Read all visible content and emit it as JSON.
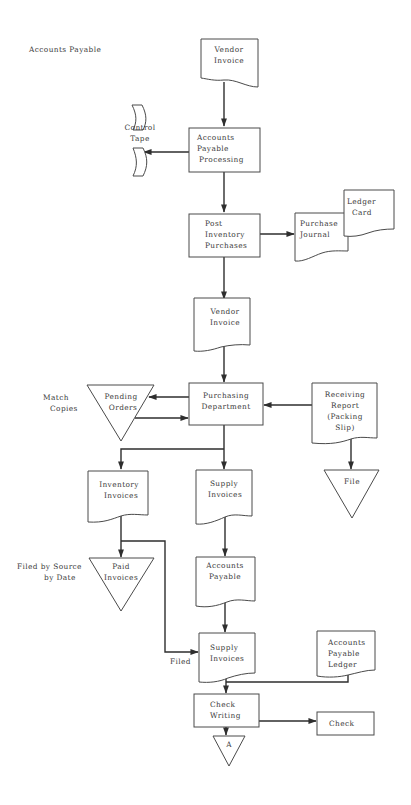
{
  "title": "Accounts Payable",
  "colors": {
    "line": "#2e2e2e",
    "shape_stroke": "#4a4a4a",
    "text": "#3a3a3a",
    "background": "#ffffff"
  },
  "nodes": {
    "vendor_invoice_1": {
      "type": "document",
      "lines": [
        "Vendor",
        "Invoice"
      ]
    },
    "control_tape": {
      "type": "punched-tape",
      "lines": [
        "Control",
        "Tape"
      ]
    },
    "ap_processing": {
      "type": "process",
      "lines": [
        "Accounts",
        "Payable",
        "Processing"
      ]
    },
    "post_inventory": {
      "type": "process",
      "lines": [
        "Post",
        "Inventory",
        "Purchases"
      ]
    },
    "purchase_journal": {
      "type": "document",
      "lines": [
        "Purchase",
        "Journal"
      ]
    },
    "ledger_card": {
      "type": "document",
      "lines": [
        "Ledger",
        "Card"
      ]
    },
    "vendor_invoice_2": {
      "type": "document",
      "lines": [
        "Vendor",
        "Invoice"
      ]
    },
    "purchasing_department": {
      "type": "process",
      "lines": [
        "Purchasing",
        "Department"
      ]
    },
    "pending_orders": {
      "type": "file",
      "lines": [
        "Pending",
        "Orders"
      ]
    },
    "receiving_report": {
      "type": "document",
      "lines": [
        "Receiving",
        "Report",
        "(Packing",
        "Slip)"
      ]
    },
    "file": {
      "type": "file",
      "lines": [
        "File"
      ]
    },
    "inventory_invoices": {
      "type": "document",
      "lines": [
        "Inventory",
        "Invoices"
      ]
    },
    "supply_invoices_1": {
      "type": "document",
      "lines": [
        "Supply",
        "Invoices"
      ]
    },
    "paid_invoices": {
      "type": "file",
      "lines": [
        "Paid",
        "Invoices"
      ]
    },
    "accounts_payable_doc": {
      "type": "document",
      "lines": [
        "Accounts",
        "Payable"
      ]
    },
    "supply_invoices_2": {
      "type": "document",
      "lines": [
        "Supply",
        "Invoices"
      ]
    },
    "ap_ledger": {
      "type": "document",
      "lines": [
        "Accounts",
        "Payable",
        "Ledger"
      ]
    },
    "check_writing": {
      "type": "process",
      "lines": [
        "Check",
        "Writing"
      ]
    },
    "check": {
      "type": "process",
      "lines": [
        "Check"
      ]
    },
    "connector_a": {
      "type": "off-page-connector",
      "lines": [
        "A"
      ]
    }
  },
  "annotations": {
    "match_copies": [
      "Match",
      "Copies"
    ],
    "filed_by_source": [
      "Filed by Source",
      "by Date"
    ],
    "filed": [
      "Filed"
    ]
  },
  "edges": [
    {
      "from": "Vendor Invoice",
      "to": "Accounts Payable Processing"
    },
    {
      "from": "Accounts Payable Processing",
      "to": "Control Tape"
    },
    {
      "from": "Accounts Payable Processing",
      "to": "Post Inventory Purchases"
    },
    {
      "from": "Post Inventory Purchases",
      "to": "Purchase Journal / Ledger Card"
    },
    {
      "from": "Post Inventory Purchases",
      "to": "Vendor Invoice"
    },
    {
      "from": "Vendor Invoice",
      "to": "Purchasing Department"
    },
    {
      "from": "Purchasing Department",
      "to": "Pending Orders"
    },
    {
      "from": "Pending Orders",
      "to": "Purchasing Department"
    },
    {
      "from": "Receiving Report (Packing Slip)",
      "to": "Purchasing Department"
    },
    {
      "from": "Receiving Report (Packing Slip)",
      "to": "File"
    },
    {
      "from": "Purchasing Department",
      "to": "Inventory Invoices"
    },
    {
      "from": "Purchasing Department",
      "to": "Supply Invoices"
    },
    {
      "from": "Inventory Invoices",
      "to": "Paid Invoices"
    },
    {
      "from": "Inventory Invoices",
      "to": "Supply Invoices (Filed)"
    },
    {
      "from": "Supply Invoices",
      "to": "Accounts Payable"
    },
    {
      "from": "Accounts Payable",
      "to": "Supply Invoices"
    },
    {
      "from": "Supply Invoices",
      "to": "Check Writing"
    },
    {
      "from": "Accounts Payable Ledger",
      "to": "Check Writing"
    },
    {
      "from": "Check Writing",
      "to": "Check"
    },
    {
      "from": "Check Writing",
      "to": "A"
    }
  ]
}
